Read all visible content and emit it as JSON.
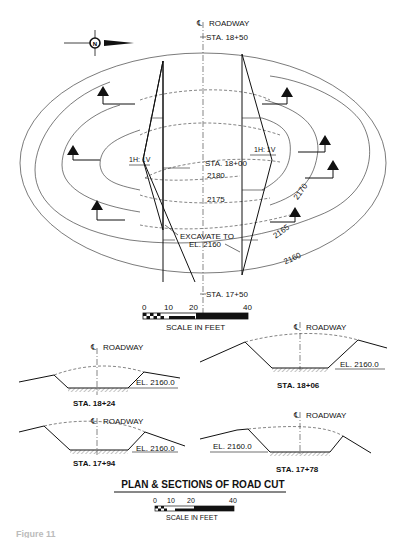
{
  "plan": {
    "centerline_label": "ROADWAY",
    "centerline_symbol": "℄",
    "station_top": "STA. 18+50",
    "station_mid": "STA. 18+00",
    "station_bottom": "STA. 17+50",
    "slope_left": "1H: 1V",
    "slope_right": "1H: 1V",
    "excavate_line1": "EXCAVATE TO",
    "excavate_line2": "EL. 2160",
    "contours": [
      "2180",
      "2175",
      "2170",
      "2165",
      "2160"
    ],
    "north_arrow_icon": "north-arrow-icon"
  },
  "scale_top": {
    "ticks": [
      "0",
      "10",
      "20",
      "40"
    ],
    "label": "SCALE IN FEET"
  },
  "sections": [
    {
      "station": "STA. 18+24",
      "centerline_label": "ROADWAY",
      "elevation": "EL. 2160.0"
    },
    {
      "station": "STA. 18+06",
      "centerline_label": "ROADWAY",
      "elevation": "EL. 2160.0"
    },
    {
      "station": "STA. 17+94",
      "centerline_label": "ROADWAY",
      "elevation": "EL. 2160.0"
    },
    {
      "station": "STA. 17+78",
      "centerline_label": "ROADWAY",
      "elevation": "EL. 2160.0"
    }
  ],
  "title": "PLAN & SECTIONS OF ROAD CUT",
  "scale_bottom": {
    "ticks": [
      "0",
      "10",
      "20",
      "40"
    ],
    "label": "SCALE IN FEET"
  },
  "caption_fragment": "Figure 11"
}
